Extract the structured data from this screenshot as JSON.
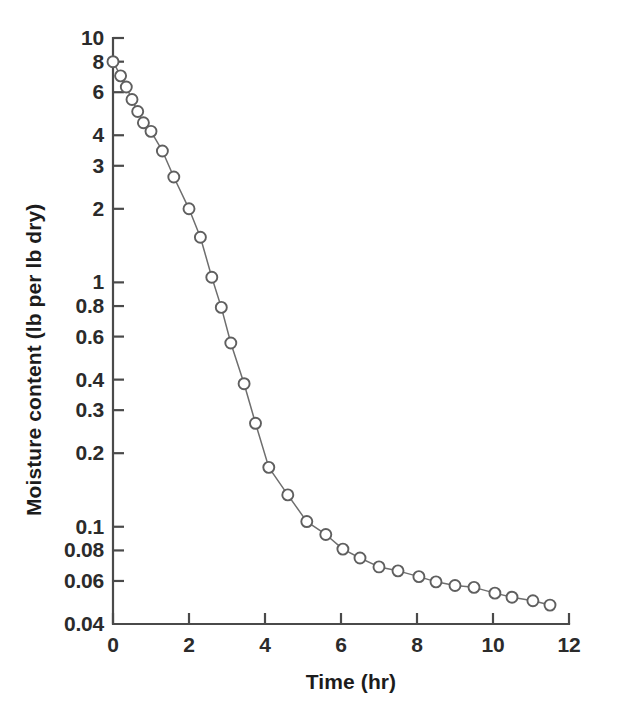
{
  "figure": {
    "background_color": "#ffffff",
    "axis_color": "#4a4a4a",
    "line_color": "#6e6e6e",
    "marker_fill": "#ffffff",
    "marker_stroke": "#5f5f5f",
    "text_color": "#1c1c1c"
  },
  "chart_data": {
    "type": "line",
    "title": "",
    "subtitle": "",
    "xlabel": "Time (hr)",
    "ylabel": "Moisture content (lb per lb dry)",
    "xscale": "linear",
    "yscale": "log",
    "xlim": [
      0,
      12
    ],
    "ylim": [
      0.04,
      10
    ],
    "grid": false,
    "legend": null,
    "legend_position": "none",
    "xticks": [
      0,
      2,
      4,
      6,
      8,
      10,
      12
    ],
    "xtick_labels": [
      "0",
      "2",
      "4",
      "6",
      "8",
      "10",
      "12"
    ],
    "yticks": [
      10,
      8,
      6,
      4,
      3,
      2,
      1,
      0.8,
      0.6,
      0.4,
      0.3,
      0.2,
      0.1,
      0.08,
      0.06,
      0.04
    ],
    "ytick_labels": [
      "10",
      "8",
      "6",
      "4",
      "3",
      "2",
      "1",
      "0.8",
      "0.6",
      "0.4",
      "0.3",
      "0.2",
      "0.1",
      "0.08",
      "0.06",
      "0.04"
    ],
    "marker": "open-circle",
    "marker_size": 11,
    "series": [
      {
        "name": "Moisture content",
        "x": [
          0.0,
          0.2,
          0.35,
          0.5,
          0.65,
          0.8,
          1.0,
          1.3,
          1.6,
          2.0,
          2.3,
          2.6,
          2.85,
          3.1,
          3.45,
          3.75,
          4.1,
          4.6,
          5.1,
          5.6,
          6.05,
          6.5,
          7.0,
          7.5,
          8.05,
          8.5,
          9.0,
          9.5,
          10.05,
          10.5,
          11.05,
          11.5
        ],
        "y": [
          8.0,
          7.0,
          6.3,
          5.6,
          5.0,
          4.5,
          4.15,
          3.45,
          2.7,
          2.0,
          1.53,
          1.05,
          0.79,
          0.565,
          0.385,
          0.265,
          0.175,
          0.135,
          0.105,
          0.093,
          0.081,
          0.0745,
          0.0685,
          0.066,
          0.0625,
          0.0595,
          0.0575,
          0.0565,
          0.0535,
          0.0515,
          0.0498,
          0.0478
        ],
        "color": "#6e6e6e"
      }
    ]
  },
  "axis_titles": {
    "x": "Time (hr)",
    "y": "Moisture content (lb per lb dry)"
  }
}
